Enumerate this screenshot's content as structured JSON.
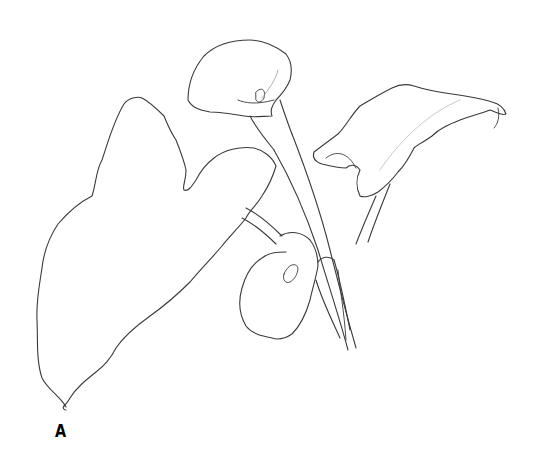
{
  "figure": {
    "label": "A",
    "stroke_color": "#3a3a3a",
    "background": "#ffffff"
  }
}
